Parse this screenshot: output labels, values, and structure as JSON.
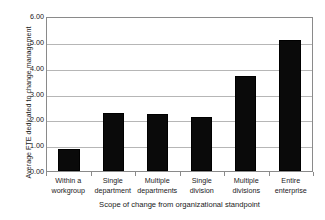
{
  "chart_data": {
    "type": "bar",
    "title": "",
    "xlabel": "Scope of change from organizational standpoint",
    "ylabel": "Average FTE dedicated to change management",
    "categories": [
      "Within a workgroup",
      "Single department",
      "Multiple departments",
      "Single division",
      "Multiple divisions",
      "Entire enterprise"
    ],
    "category_lines": [
      [
        "Within a",
        "workgroup"
      ],
      [
        "Single",
        "department"
      ],
      [
        "Multiple",
        "departments"
      ],
      [
        "Single",
        "division"
      ],
      [
        "Multiple",
        "divisions"
      ],
      [
        "Entire",
        "enterprise"
      ]
    ],
    "values": [
      0.85,
      2.25,
      2.22,
      2.1,
      3.68,
      5.08
    ],
    "ylim": [
      0.0,
      6.0
    ],
    "ytick_values": [
      0.0,
      1.0,
      2.0,
      3.0,
      4.0,
      5.0,
      6.0
    ],
    "ytick_labels": [
      "0.00",
      "1.00",
      "2.00",
      "3.00",
      "4.00",
      "5.00",
      "6.00"
    ],
    "grid": true,
    "legend": "none",
    "bar_color": "#0a0a0a",
    "gridline_color": "#b6b6b6",
    "axis_color": "#8a8a8a",
    "background_color": "#ffffff"
  }
}
